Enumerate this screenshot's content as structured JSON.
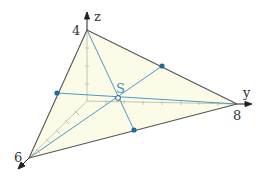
{
  "diagram": {
    "type": "3d-coordinate-triangle-centroid",
    "colors": {
      "fill": "#fbfbe8",
      "edge": "#555555",
      "median": "#4a9ac9",
      "axis": "#222222",
      "hidden_axis": "#b8b8a8",
      "point": "#1f6a96",
      "label_s": "#3a8fc0"
    },
    "axes": {
      "x": {
        "label": "",
        "tick_value": "6"
      },
      "y": {
        "label": "y",
        "tick_value": "8"
      },
      "z": {
        "label": "z",
        "tick_value": "4"
      }
    },
    "vertices": {
      "A": {
        "coord": [
          0,
          0,
          4
        ],
        "px": [
          87,
          30
        ],
        "label": "4"
      },
      "B": {
        "coord": [
          0,
          8,
          0
        ],
        "px": [
          237,
          104
        ],
        "label": "8"
      },
      "C": {
        "coord": [
          6,
          0,
          0
        ],
        "px": [
          29,
          158
        ],
        "label": "6"
      }
    },
    "origin_px": [
      87,
      101
    ],
    "centroid": {
      "label": "S",
      "px": [
        118,
        98
      ]
    },
    "midpoints": [
      {
        "edge": "AB",
        "px": [
          162,
          66
        ]
      },
      {
        "edge": "AC",
        "px": [
          57,
          93
        ]
      },
      {
        "edge": "BC",
        "px": [
          134,
          130
        ]
      }
    ]
  }
}
